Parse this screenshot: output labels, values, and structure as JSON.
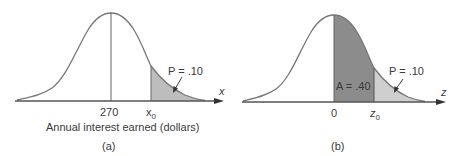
{
  "panel_a": {
    "caption": "(a)",
    "axis_label": "x",
    "x_label": "Annual interest earned (dollars)",
    "mean_tick": "270",
    "x0_tick": "x",
    "x0_sub": "0",
    "p_label": "P = .10",
    "shaded_color": "#bdbdbd"
  },
  "panel_b": {
    "caption": "(b)",
    "axis_label": "z",
    "zero_tick": "0",
    "z0_tick": "z",
    "z0_sub": "0",
    "a_label": "A = .40",
    "p_label": "P = .10",
    "dark_color": "#8c8c8c",
    "light_color": "#cfcfcf"
  }
}
